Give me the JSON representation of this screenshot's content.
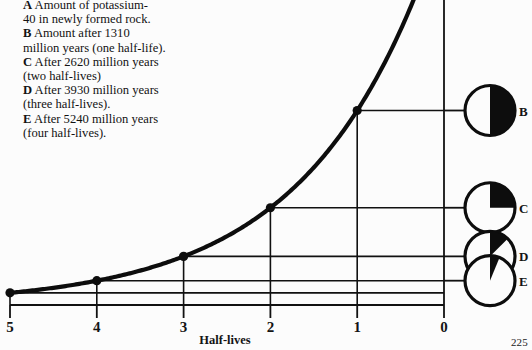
{
  "figure": {
    "page_number": "225",
    "axis": {
      "xlabel": "Half-lives",
      "xticks": [
        "5",
        "4",
        "3",
        "2",
        "1",
        "0"
      ]
    },
    "legend": {
      "entries": [
        {
          "key": "A",
          "lines": [
            "Amount of potassium-",
            "40 in newly formed rock."
          ]
        },
        {
          "key": "B",
          "lines": [
            "Amount after 1310",
            "million years (one half-life)."
          ]
        },
        {
          "key": "C",
          "lines": [
            "After 2620 million years",
            "(two half-lives)"
          ]
        },
        {
          "key": "D",
          "lines": [
            "After 3930 million years",
            "(three half-lives)."
          ]
        },
        {
          "key": "E",
          "lines": [
            "After 5240 million years",
            "(four half-lives)."
          ]
        }
      ]
    },
    "pies": [
      {
        "label": "B",
        "fraction": 0.5
      },
      {
        "label": "C",
        "fraction": 0.25
      },
      {
        "label": "D",
        "fraction": 0.125
      },
      {
        "label": "E",
        "fraction": 0.0625
      }
    ]
  },
  "chart_data": {
    "type": "line",
    "title": "",
    "xlabel": "Half-lives",
    "ylabel": "",
    "x": [
      5,
      4,
      3,
      2,
      1,
      0
    ],
    "values": [
      0.03125,
      0.0625,
      0.125,
      0.25,
      0.5,
      1.0
    ],
    "point_labels": [
      "E",
      "D",
      "C",
      "B",
      "A",
      ""
    ],
    "xlim": [
      5,
      0
    ],
    "ylim": [
      0,
      1
    ],
    "x_axis_reversed": true,
    "grid": true,
    "legend_position": "none",
    "annotations": [
      "A = amount of potassium-40 in newly formed rock (0 half-lives)",
      "B = 1/2 remaining after 1310 million years",
      "C = 1/4 remaining after 2620 million years",
      "D = 1/8 remaining after 3930 million years",
      "E = 1/16 remaining after 5240 million years"
    ]
  }
}
